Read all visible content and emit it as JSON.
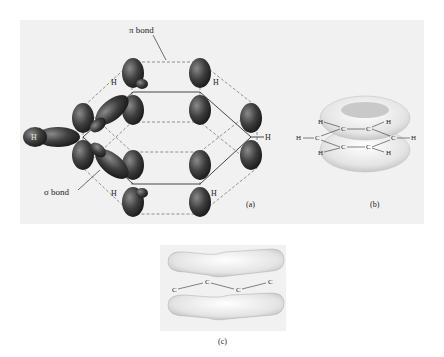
{
  "figure": {
    "panel_a": {
      "label": "(a)",
      "pi_bond_label": "π bond",
      "sigma_bond_label": "σ bond",
      "atom_label": "H"
    },
    "panel_b": {
      "label": "(b)",
      "atoms": {
        "h": "H",
        "c": "C"
      }
    },
    "panel_c": {
      "label": "(c)",
      "atom": "C"
    }
  }
}
